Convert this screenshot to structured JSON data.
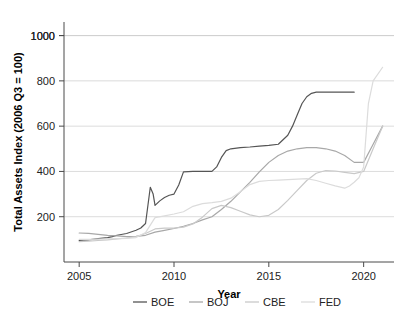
{
  "figure": {
    "clipped_title": "Total Assets by Year, BOE, BOJ, CBE and FED",
    "background": "#ffffff"
  },
  "chart_data": {
    "type": "line",
    "title": "",
    "xlabel": "Year",
    "ylabel": "Total Assets Index (2006 Q3 = 100)",
    "xlim": [
      2004.2,
      2021.6
    ],
    "ylim": [
      0,
      1060
    ],
    "xticks": [
      2005,
      2010,
      2015,
      2020
    ],
    "xtick_labels": [
      "2005",
      "2010",
      "2015",
      "2020"
    ],
    "yticks": [
      200,
      400,
      600,
      800,
      1000
    ],
    "ytick_labels": [
      "200",
      "400",
      "600",
      "800",
      "1000"
    ],
    "grid": "horizontal",
    "grid_color": "#cccccc",
    "legend_position": "bottom",
    "series": [
      {
        "name": "BOE",
        "color": "#555555",
        "x": [
          2005.0,
          2005.5,
          2006.0,
          2006.5,
          2006.75,
          2007.0,
          2007.5,
          2008.0,
          2008.25,
          2008.5,
          2008.75,
          2008.9,
          2009.0,
          2009.25,
          2009.5,
          2009.75,
          2010.0,
          2010.25,
          2010.5,
          2011.0,
          2011.5,
          2012.0,
          2012.25,
          2012.5,
          2012.75,
          2013.0,
          2013.5,
          2014.0,
          2014.5,
          2015.0,
          2015.5,
          2016.0,
          2016.25,
          2016.5,
          2016.75,
          2017.0,
          2017.25,
          2017.5,
          2018.0,
          2018.5,
          2019.0,
          2019.5
        ],
        "y": [
          95,
          98,
          103,
          108,
          112,
          118,
          126,
          140,
          150,
          170,
          330,
          300,
          250,
          270,
          285,
          295,
          300,
          340,
          398,
          400,
          400,
          400,
          420,
          462,
          492,
          500,
          505,
          508,
          512,
          515,
          520,
          560,
          600,
          650,
          700,
          730,
          745,
          750,
          750,
          750,
          750,
          750
        ]
      },
      {
        "name": "BOJ",
        "color": "#a8a8a8",
        "x": [
          2005.0,
          2005.5,
          2006.0,
          2006.5,
          2007.0,
          2007.5,
          2008.0,
          2008.5,
          2009.0,
          2009.5,
          2010.0,
          2010.5,
          2011.0,
          2011.5,
          2012.0,
          2012.5,
          2013.0,
          2013.5,
          2014.0,
          2014.5,
          2015.0,
          2015.5,
          2016.0,
          2016.5,
          2017.0,
          2017.5,
          2018.0,
          2018.5,
          2019.0,
          2019.5,
          2020.0,
          2020.5,
          2021.0
        ],
        "y": [
          128,
          126,
          122,
          118,
          115,
          112,
          113,
          118,
          132,
          140,
          148,
          158,
          170,
          186,
          200,
          232,
          268,
          310,
          352,
          398,
          440,
          470,
          490,
          500,
          505,
          505,
          500,
          490,
          470,
          440,
          440,
          520,
          600
        ]
      },
      {
        "name": "CBE",
        "color": "#c9c9c9",
        "x": [
          2005.0,
          2005.5,
          2006.0,
          2006.5,
          2007.0,
          2007.5,
          2008.0,
          2008.5,
          2009.0,
          2009.5,
          2010.0,
          2010.5,
          2011.0,
          2011.5,
          2012.0,
          2012.5,
          2013.0,
          2013.5,
          2014.0,
          2014.5,
          2015.0,
          2015.5,
          2016.0,
          2016.5,
          2017.0,
          2017.5,
          2018.0,
          2018.5,
          2019.0,
          2019.5,
          2020.0,
          2020.5,
          2021.0
        ],
        "y": [
          90,
          92,
          95,
          98,
          102,
          106,
          112,
          126,
          146,
          150,
          150,
          154,
          168,
          198,
          236,
          250,
          240,
          224,
          208,
          200,
          206,
          232,
          272,
          316,
          360,
          392,
          404,
          402,
          396,
          390,
          400,
          500,
          600
        ]
      },
      {
        "name": "FED",
        "color": "#dcdcdc",
        "x": [
          2005.0,
          2005.5,
          2006.0,
          2006.5,
          2007.0,
          2007.5,
          2008.0,
          2008.5,
          2009.0,
          2009.5,
          2010.0,
          2010.5,
          2011.0,
          2011.5,
          2012.0,
          2012.5,
          2013.0,
          2013.5,
          2014.0,
          2014.5,
          2015.0,
          2015.5,
          2016.0,
          2016.5,
          2017.0,
          2017.5,
          2018.0,
          2018.5,
          2019.0,
          2019.25,
          2019.5,
          2019.75,
          2020.0,
          2020.25,
          2020.5,
          2021.0
        ],
        "y": [
          100,
          100,
          101,
          102,
          103,
          104,
          108,
          130,
          196,
          204,
          212,
          222,
          246,
          258,
          262,
          268,
          282,
          310,
          342,
          356,
          360,
          362,
          364,
          366,
          368,
          360,
          348,
          336,
          326,
          336,
          352,
          372,
          420,
          700,
          800,
          860
        ]
      }
    ]
  },
  "legend": {
    "entries": [
      {
        "label": "BOE",
        "color": "#555555"
      },
      {
        "label": "BOJ",
        "color": "#a8a8a8"
      },
      {
        "label": "CBE",
        "color": "#c9c9c9"
      },
      {
        "label": "FED",
        "color": "#dcdcdc"
      }
    ]
  }
}
